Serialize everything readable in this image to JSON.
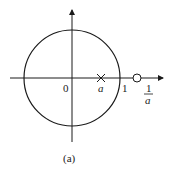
{
  "diagram": {
    "type": "pole-zero plot",
    "caption": "(a)",
    "origin_label": "0",
    "unit_label": "1",
    "pole_label": "a",
    "zero_label_numerator": "1",
    "zero_label_denominator": "a",
    "elements": {
      "unit_circle": "circle",
      "pole": "×",
      "zero": "○"
    },
    "colors": {
      "stroke": "#1a1a1a",
      "background": "#ffffff"
    }
  }
}
